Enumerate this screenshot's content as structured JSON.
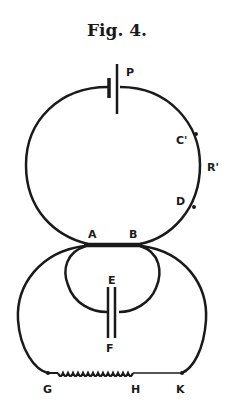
{
  "figure": {
    "title": "Fig. 4.",
    "labels": {
      "P": "P",
      "C": "C'",
      "R": "R'",
      "D": "D",
      "A": "A",
      "B": "B",
      "E": "E",
      "F": "F",
      "G": "G",
      "H": "H",
      "K": "K"
    },
    "colors": {
      "ink": "#1a1a1a",
      "background": "#ffffff"
    }
  }
}
